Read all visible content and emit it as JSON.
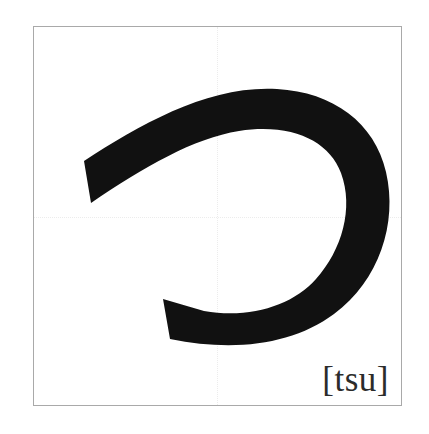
{
  "card": {
    "type": "hiragana-character-card",
    "character": "つ",
    "romanization": "[tsu]",
    "stroke_count": 1,
    "frame": {
      "border_color": "#a9a9a9",
      "background_color": "#ffffff"
    },
    "guides": {
      "color": "#ececec",
      "style": "dotted",
      "horizontal_label": "center-horizontal-guide",
      "vertical_label": "center-vertical-guide"
    },
    "glyph": {
      "name": "tsu-stroke",
      "color": "#111111",
      "description": "single hook stroke curving from upper-left rightward and down, hooking back to the left"
    }
  }
}
